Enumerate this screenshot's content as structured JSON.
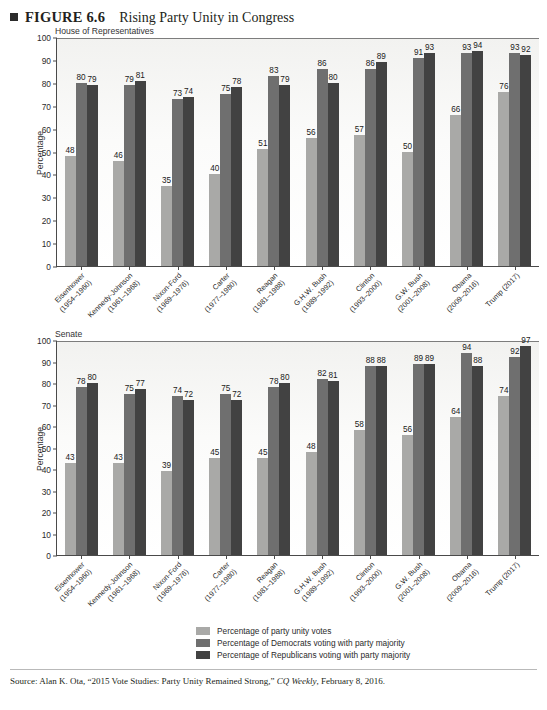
{
  "figure": {
    "number": "FIGURE 6.6",
    "title": "Rising Party Unity in Congress",
    "bullet": "square-bullet-icon"
  },
  "source": {
    "prefix": "Source:",
    "text": "Alan K. Ota, “2015 Vote Studies: Party Unity Remained Strong,”",
    "italic": "CQ Weekly",
    "suffix": ", February 8, 2016."
  },
  "legend": {
    "position": "bottom-center",
    "items": [
      {
        "label": "Percentage of party unity votes",
        "color": "#a9a9a7"
      },
      {
        "label": "Percentage of Democrats voting with party majority",
        "color": "#6f6f6f"
      },
      {
        "label": "Percentage of Republicans voting with party majority",
        "color": "#424242"
      }
    ]
  },
  "chart_data": [
    {
      "type": "bar",
      "title": "House of Representatives",
      "xlabel": "",
      "ylabel": "Percentage",
      "ylim": [
        0,
        100
      ],
      "yticks": [
        0,
        10,
        20,
        30,
        40,
        50,
        60,
        70,
        80,
        90,
        100
      ],
      "grid": false,
      "categories": [
        "Eisenhower\n(1954–1960)",
        "Kennedy-Johnson\n(1961–1968)",
        "Nixon-Ford\n(1969–1976)",
        "Carter\n(1977–1980)",
        "Reagan\n(1981–1988)",
        "G.H.W. Bush\n(1989–1992)",
        "Clinton\n(1993–2000)",
        "G.W. Bush\n(2001–2008)",
        "Obama\n(2009–2016)",
        "Trump (2017)"
      ],
      "series": [
        {
          "name": "Percentage of party unity votes",
          "color": "#a9a9a7",
          "values": [
            48,
            46,
            35,
            40,
            51,
            56,
            57,
            50,
            66,
            76
          ]
        },
        {
          "name": "Percentage of Democrats voting with party majority",
          "color": "#6f6f6f",
          "values": [
            80,
            79,
            73,
            75,
            83,
            86,
            86,
            91,
            93,
            93
          ]
        },
        {
          "name": "Percentage of Republicans voting with party majority",
          "color": "#424242",
          "values": [
            79,
            81,
            74,
            78,
            79,
            80,
            89,
            93,
            94,
            92
          ]
        }
      ]
    },
    {
      "type": "bar",
      "title": "Senate",
      "xlabel": "",
      "ylabel": "Percentage",
      "ylim": [
        0,
        100
      ],
      "yticks": [
        0,
        10,
        20,
        30,
        40,
        50,
        60,
        70,
        80,
        90,
        100
      ],
      "grid": false,
      "categories": [
        "Eisenhower\n(1954–1960)",
        "Kennedy-Johnson\n(1961–1968)",
        "Nixon-Ford\n(1969–1976)",
        "Carter\n(1977–1980)",
        "Reagan\n(1981–1988)",
        "G.H.W. Bush\n(1989–1992)",
        "Clinton\n(1993–2000)",
        "G.W. Bush\n(2001–2008)",
        "Obama\n(2009–2016)",
        "Trump (2017)"
      ],
      "series": [
        {
          "name": "Percentage of party unity votes",
          "color": "#a9a9a7",
          "values": [
            43,
            43,
            39,
            45,
            45,
            48,
            58,
            56,
            64,
            74
          ]
        },
        {
          "name": "Percentage of Democrats voting with party majority",
          "color": "#6f6f6f",
          "values": [
            78,
            75,
            74,
            75,
            78,
            82,
            88,
            89,
            94,
            92
          ]
        },
        {
          "name": "Percentage of Republicans voting with party majority",
          "color": "#424242",
          "values": [
            80,
            77,
            72,
            72,
            80,
            81,
            88,
            89,
            88,
            97
          ]
        }
      ]
    }
  ]
}
